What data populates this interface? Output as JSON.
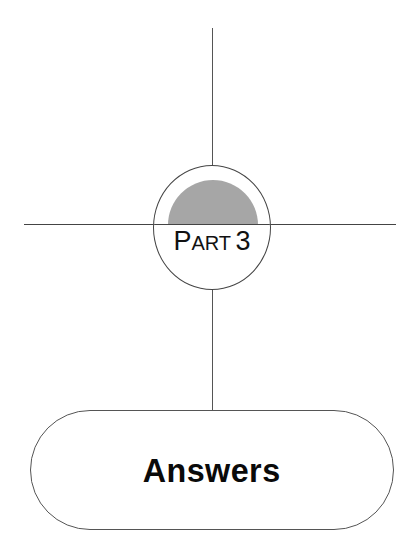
{
  "part": {
    "prefix_initial": "P",
    "prefix_rest": "ART",
    "number": "3"
  },
  "section": {
    "title": "Answers"
  },
  "colors": {
    "line": "#444444",
    "disc_fill": "#a6a6a6",
    "text": "#111111",
    "background": "#ffffff"
  }
}
